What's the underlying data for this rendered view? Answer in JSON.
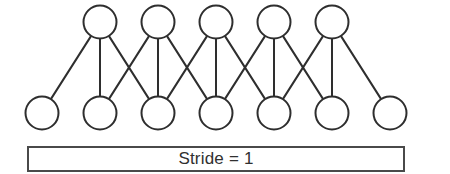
{
  "diagram": {
    "stroke_color": "#2e2e2e",
    "node_fill": "#ffffff",
    "background": "#ffffff",
    "box_border_color": "#4a4a4a",
    "node_radius": 16.5,
    "output_layer": {
      "name": "output-layer",
      "count": 5,
      "y": 22,
      "x_positions": [
        100,
        158,
        216,
        274,
        332
      ]
    },
    "input_layer": {
      "name": "input-layer",
      "count": 7,
      "y": 113,
      "x_positions": [
        42,
        100,
        158,
        216,
        274,
        332,
        390
      ]
    },
    "kernel_size": 3,
    "stride": 1,
    "edges": [
      [
        0,
        0
      ],
      [
        0,
        1
      ],
      [
        0,
        2
      ],
      [
        1,
        1
      ],
      [
        1,
        2
      ],
      [
        1,
        3
      ],
      [
        2,
        2
      ],
      [
        2,
        3
      ],
      [
        2,
        4
      ],
      [
        3,
        3
      ],
      [
        3,
        4
      ],
      [
        3,
        5
      ],
      [
        4,
        4
      ],
      [
        4,
        5
      ],
      [
        4,
        6
      ]
    ]
  },
  "caption": {
    "text": "Stride = 1"
  }
}
